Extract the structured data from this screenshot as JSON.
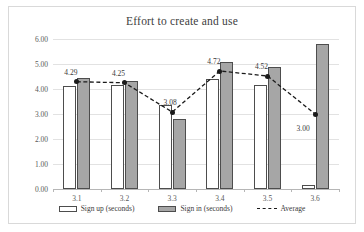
{
  "chart_data": {
    "type": "bar",
    "title": "Effort to create and use",
    "xlabel": "",
    "ylabel": "",
    "ylim": [
      0,
      6
    ],
    "ytick_labels": [
      "0.00",
      "1.00",
      "2.00",
      "3.00",
      "4.00",
      "5.00",
      "6.00"
    ],
    "ytick_values": [
      0,
      1,
      2,
      3,
      4,
      5,
      6
    ],
    "grid": true,
    "legend_position": "bottom",
    "categories": [
      "3.1",
      "3.2",
      "3.3",
      "3.4",
      "3.5",
      "3.6"
    ],
    "series": [
      {
        "name": "Sign up (seconds)",
        "type": "bar",
        "color": "#ffffff",
        "border": "#4d4d4d",
        "values": [
          4.14,
          4.17,
          3.35,
          4.4,
          4.16,
          0.15
        ]
      },
      {
        "name": "Sign in (seconds)",
        "type": "bar",
        "color": "#a6a6a6",
        "border": "#4d4d4d",
        "values": [
          4.43,
          4.32,
          2.81,
          5.08,
          4.9,
          5.8
        ]
      },
      {
        "name": "Average",
        "type": "line",
        "color": "#1a1a1a",
        "linestyle": "dashed",
        "marker": "circle",
        "values": [
          4.29,
          4.25,
          3.08,
          4.72,
          4.52,
          3.0
        ],
        "data_labels": [
          "4.29",
          "4.25",
          "3.08",
          "4.72",
          "4.52",
          "3.00"
        ]
      }
    ]
  },
  "legend": {
    "items": [
      {
        "label": "Sign up (seconds)"
      },
      {
        "label": "Sign in (seconds)"
      },
      {
        "label": "Average"
      }
    ]
  }
}
